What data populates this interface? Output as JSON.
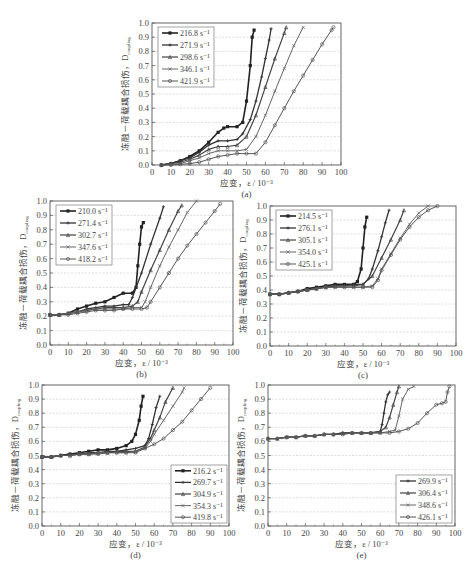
{
  "figure": {
    "y_axis_label": "冻融－荷载耦合损伤，D",
    "y_axis_subscript": "coupling",
    "x_axis_label": "应变，ε / 10⁻³",
    "x_ticks": [
      "0",
      "10",
      "20",
      "30",
      "40",
      "50",
      "60",
      "70",
      "80",
      "90",
      "100"
    ],
    "y_ticks": [
      "0.0",
      "0.1",
      "0.2",
      "0.3",
      "0.4",
      "0.5",
      "0.6",
      "0.7",
      "0.8",
      "0.9",
      "1.0"
    ]
  },
  "chart_data": [
    {
      "id": "a",
      "caption": "(a)",
      "type": "line",
      "xlabel": "应变，ε / 10⁻³",
      "ylabel": "冻融－荷载耦合损伤，D_coupling",
      "xlim": [
        0,
        100
      ],
      "ylim": [
        0,
        1.0
      ],
      "grid": true,
      "legend_position": "upper-left",
      "series": [
        {
          "name": "216.8 s⁻¹",
          "x": [
            5,
            10,
            15,
            20,
            25,
            30,
            35,
            38,
            40,
            45,
            48,
            50,
            52,
            53,
            54
          ],
          "y": [
            0,
            0.01,
            0.03,
            0.06,
            0.1,
            0.16,
            0.23,
            0.26,
            0.27,
            0.27,
            0.3,
            0.45,
            0.7,
            0.9,
            0.95
          ]
        },
        {
          "name": "271.9 s⁻¹",
          "x": [
            5,
            10,
            15,
            20,
            25,
            30,
            35,
            40,
            45,
            48,
            52,
            55,
            58,
            60,
            62,
            63
          ],
          "y": [
            0,
            0.01,
            0.03,
            0.05,
            0.09,
            0.14,
            0.17,
            0.17,
            0.18,
            0.22,
            0.32,
            0.45,
            0.62,
            0.75,
            0.88,
            0.96
          ]
        },
        {
          "name": "298.6 s⁻¹",
          "x": [
            5,
            10,
            15,
            20,
            25,
            30,
            35,
            40,
            45,
            50,
            55,
            60,
            65,
            70,
            71
          ],
          "y": [
            0,
            0.01,
            0.02,
            0.04,
            0.07,
            0.11,
            0.13,
            0.13,
            0.14,
            0.2,
            0.35,
            0.55,
            0.75,
            0.93,
            0.97
          ]
        },
        {
          "name": "346.1 s⁻¹",
          "x": [
            5,
            10,
            15,
            20,
            25,
            30,
            35,
            40,
            45,
            50,
            55,
            60,
            65,
            70,
            75,
            80
          ],
          "y": [
            0,
            0.005,
            0.01,
            0.03,
            0.05,
            0.08,
            0.1,
            0.1,
            0.1,
            0.11,
            0.2,
            0.35,
            0.52,
            0.68,
            0.84,
            0.97
          ]
        },
        {
          "name": "421.9 s⁻¹",
          "x": [
            5,
            10,
            15,
            20,
            25,
            30,
            35,
            40,
            45,
            50,
            55,
            60,
            65,
            70,
            75,
            80,
            85,
            90,
            95,
            96
          ],
          "y": [
            0,
            0.0,
            0.005,
            0.01,
            0.02,
            0.04,
            0.06,
            0.07,
            0.08,
            0.08,
            0.08,
            0.16,
            0.28,
            0.4,
            0.52,
            0.63,
            0.74,
            0.85,
            0.95,
            0.97
          ]
        }
      ]
    },
    {
      "id": "b",
      "caption": "(b)",
      "type": "line",
      "xlabel": "应变，ε / 10⁻³",
      "ylabel": "冻融－荷载耦合损伤，D_coupling",
      "xlim": [
        0,
        100
      ],
      "ylim": [
        0,
        1.0
      ],
      "grid": true,
      "legend_position": "upper-left",
      "series": [
        {
          "name": "210.0 s⁻¹",
          "x": [
            0,
            5,
            10,
            15,
            20,
            25,
            30,
            35,
            40,
            45,
            47,
            48,
            49,
            50,
            51
          ],
          "y": [
            0.21,
            0.21,
            0.22,
            0.25,
            0.27,
            0.29,
            0.3,
            0.33,
            0.36,
            0.36,
            0.4,
            0.55,
            0.7,
            0.82,
            0.85
          ]
        },
        {
          "name": "271.4 s⁻¹",
          "x": [
            0,
            5,
            10,
            15,
            20,
            25,
            30,
            35,
            40,
            43,
            45,
            50,
            55,
            60,
            62
          ],
          "y": [
            0.21,
            0.21,
            0.22,
            0.23,
            0.25,
            0.26,
            0.27,
            0.27,
            0.28,
            0.28,
            0.33,
            0.5,
            0.7,
            0.88,
            0.96
          ]
        },
        {
          "name": "302.7 s⁻¹",
          "x": [
            0,
            5,
            10,
            15,
            20,
            25,
            30,
            35,
            40,
            45,
            48,
            50,
            55,
            60,
            65,
            70,
            72
          ],
          "y": [
            0.21,
            0.21,
            0.22,
            0.23,
            0.24,
            0.25,
            0.26,
            0.26,
            0.26,
            0.27,
            0.3,
            0.37,
            0.52,
            0.66,
            0.8,
            0.93,
            0.97
          ]
        },
        {
          "name": "347.6 s⁻¹",
          "x": [
            0,
            5,
            10,
            15,
            20,
            25,
            30,
            35,
            40,
            45,
            50,
            52,
            55,
            60,
            65,
            70,
            75,
            80
          ],
          "y": [
            0.21,
            0.21,
            0.22,
            0.23,
            0.24,
            0.25,
            0.25,
            0.25,
            0.25,
            0.26,
            0.26,
            0.3,
            0.4,
            0.55,
            0.68,
            0.8,
            0.92,
            1.0
          ]
        },
        {
          "name": "418.2 s⁻¹",
          "x": [
            0,
            5,
            10,
            15,
            20,
            25,
            30,
            35,
            40,
            45,
            50,
            53,
            55,
            60,
            65,
            70,
            75,
            80,
            85,
            90,
            93
          ],
          "y": [
            0.21,
            0.21,
            0.21,
            0.22,
            0.23,
            0.24,
            0.24,
            0.24,
            0.25,
            0.25,
            0.25,
            0.26,
            0.3,
            0.4,
            0.5,
            0.6,
            0.69,
            0.77,
            0.85,
            0.93,
            0.98
          ]
        }
      ]
    },
    {
      "id": "c",
      "caption": "(c)",
      "type": "line",
      "xlabel": "应变，ε / 10⁻³",
      "ylabel": "冻融－荷载耦合损伤，D_coupling",
      "xlim": [
        0,
        100
      ],
      "ylim": [
        0,
        1.0
      ],
      "grid": true,
      "legend_position": "upper-left",
      "series": [
        {
          "name": "214.5 s⁻¹",
          "x": [
            0,
            5,
            10,
            15,
            20,
            25,
            30,
            35,
            40,
            45,
            47,
            49,
            50,
            51,
            52
          ],
          "y": [
            0.37,
            0.37,
            0.38,
            0.39,
            0.41,
            0.42,
            0.43,
            0.44,
            0.44,
            0.44,
            0.46,
            0.55,
            0.7,
            0.85,
            0.92
          ]
        },
        {
          "name": "276.1 s⁻¹",
          "x": [
            0,
            5,
            10,
            15,
            20,
            25,
            30,
            35,
            40,
            45,
            50,
            53,
            55,
            58,
            60,
            62,
            64
          ],
          "y": [
            0.37,
            0.37,
            0.38,
            0.39,
            0.4,
            0.41,
            0.42,
            0.43,
            0.43,
            0.44,
            0.44,
            0.48,
            0.55,
            0.68,
            0.78,
            0.88,
            0.97
          ]
        },
        {
          "name": "305.1 s⁻¹",
          "x": [
            0,
            5,
            10,
            15,
            20,
            25,
            30,
            35,
            40,
            45,
            50,
            55,
            60,
            65,
            70,
            72
          ],
          "y": [
            0.37,
            0.37,
            0.38,
            0.39,
            0.4,
            0.41,
            0.42,
            0.43,
            0.43,
            0.43,
            0.44,
            0.5,
            0.63,
            0.76,
            0.9,
            0.97
          ]
        },
        {
          "name": "354.0 s⁻¹",
          "x": [
            0,
            5,
            10,
            15,
            20,
            25,
            30,
            35,
            40,
            45,
            50,
            55,
            58,
            60,
            65,
            70,
            75,
            80,
            85
          ],
          "y": [
            0.37,
            0.37,
            0.38,
            0.39,
            0.4,
            0.41,
            0.42,
            0.42,
            0.42,
            0.42,
            0.42,
            0.43,
            0.48,
            0.55,
            0.66,
            0.77,
            0.87,
            0.95,
            1.0
          ]
        },
        {
          "name": "425.1 s⁻¹",
          "x": [
            0,
            5,
            10,
            15,
            20,
            25,
            30,
            35,
            40,
            45,
            50,
            55,
            58,
            60,
            65,
            70,
            75,
            80,
            85,
            90
          ],
          "y": [
            0.37,
            0.37,
            0.38,
            0.39,
            0.4,
            0.41,
            0.42,
            0.42,
            0.42,
            0.42,
            0.42,
            0.42,
            0.47,
            0.54,
            0.65,
            0.76,
            0.85,
            0.92,
            0.97,
            1.0
          ]
        }
      ]
    },
    {
      "id": "d",
      "caption": "(d)",
      "type": "line",
      "xlabel": "应变，ε / 10⁻³",
      "ylabel": "冻融－荷载耦合损伤，D_coupling",
      "xlim": [
        0,
        100
      ],
      "ylim": [
        0,
        1.0
      ],
      "grid": true,
      "legend_position": "lower-right",
      "series": [
        {
          "name": "216.2 s⁻¹",
          "x": [
            0,
            5,
            10,
            15,
            20,
            25,
            30,
            35,
            40,
            45,
            48,
            50,
            52,
            53,
            54
          ],
          "y": [
            0.49,
            0.49,
            0.5,
            0.51,
            0.52,
            0.53,
            0.54,
            0.54,
            0.55,
            0.57,
            0.6,
            0.65,
            0.75,
            0.85,
            0.92
          ]
        },
        {
          "name": "269.7 s⁻¹",
          "x": [
            0,
            5,
            10,
            15,
            20,
            25,
            30,
            35,
            40,
            45,
            50,
            55,
            57,
            59,
            61,
            63
          ],
          "y": [
            0.49,
            0.49,
            0.5,
            0.51,
            0.51,
            0.52,
            0.52,
            0.53,
            0.53,
            0.54,
            0.55,
            0.57,
            0.62,
            0.72,
            0.84,
            0.92
          ]
        },
        {
          "name": "304.9 s⁻¹",
          "x": [
            0,
            5,
            10,
            15,
            20,
            25,
            30,
            35,
            40,
            45,
            50,
            55,
            58,
            60,
            63,
            66,
            70
          ],
          "y": [
            0.49,
            0.49,
            0.5,
            0.5,
            0.51,
            0.51,
            0.52,
            0.52,
            0.53,
            0.53,
            0.53,
            0.56,
            0.62,
            0.68,
            0.77,
            0.88,
            0.98
          ]
        },
        {
          "name": "354.3 s⁻¹",
          "x": [
            0,
            5,
            10,
            15,
            20,
            25,
            30,
            35,
            40,
            45,
            50,
            55,
            58,
            60,
            65,
            70,
            75,
            76
          ],
          "y": [
            0.49,
            0.49,
            0.5,
            0.5,
            0.51,
            0.51,
            0.52,
            0.52,
            0.52,
            0.52,
            0.53,
            0.55,
            0.6,
            0.65,
            0.75,
            0.85,
            0.95,
            0.98
          ]
        },
        {
          "name": "419.8 s⁻¹",
          "x": [
            0,
            5,
            10,
            15,
            20,
            25,
            30,
            35,
            40,
            45,
            50,
            55,
            60,
            65,
            70,
            75,
            80,
            85,
            90
          ],
          "y": [
            0.49,
            0.49,
            0.5,
            0.5,
            0.51,
            0.51,
            0.51,
            0.52,
            0.52,
            0.52,
            0.52,
            0.55,
            0.58,
            0.62,
            0.68,
            0.74,
            0.82,
            0.9,
            0.98
          ]
        }
      ]
    },
    {
      "id": "e",
      "caption": "(e)",
      "type": "line",
      "xlabel": "应变，ε / 10⁻³",
      "ylabel": "冻融－荷载耦合损伤，D_coupling",
      "xlim": [
        0,
        100
      ],
      "ylim": [
        0,
        1.0
      ],
      "grid": true,
      "legend_position": "lower-right",
      "series": [
        {
          "name": "269.9 s⁻¹",
          "x": [
            0,
            5,
            10,
            15,
            20,
            25,
            30,
            35,
            40,
            45,
            50,
            55,
            60,
            61,
            62,
            63,
            64,
            65
          ],
          "y": [
            0.62,
            0.62,
            0.63,
            0.63,
            0.64,
            0.64,
            0.65,
            0.65,
            0.66,
            0.66,
            0.66,
            0.66,
            0.67,
            0.72,
            0.8,
            0.88,
            0.93,
            0.95
          ]
        },
        {
          "name": "306.4 s⁻¹",
          "x": [
            0,
            5,
            10,
            15,
            20,
            25,
            30,
            35,
            40,
            45,
            50,
            55,
            60,
            63,
            65,
            67,
            69,
            70
          ],
          "y": [
            0.62,
            0.62,
            0.63,
            0.63,
            0.64,
            0.64,
            0.65,
            0.65,
            0.66,
            0.66,
            0.66,
            0.66,
            0.67,
            0.7,
            0.77,
            0.86,
            0.95,
            0.99
          ]
        },
        {
          "name": "348.6 s⁻¹",
          "x": [
            0,
            5,
            10,
            15,
            20,
            25,
            30,
            35,
            40,
            45,
            50,
            55,
            60,
            65,
            68,
            70,
            72,
            75,
            78
          ],
          "y": [
            0.62,
            0.62,
            0.63,
            0.63,
            0.64,
            0.64,
            0.65,
            0.65,
            0.65,
            0.66,
            0.66,
            0.66,
            0.66,
            0.67,
            0.68,
            0.78,
            0.9,
            0.97,
            0.99
          ]
        },
        {
          "name": "426.1 s⁻¹",
          "x": [
            0,
            5,
            10,
            15,
            20,
            25,
            30,
            35,
            40,
            45,
            50,
            55,
            60,
            65,
            70,
            75,
            80,
            85,
            90,
            93,
            95,
            96,
            97
          ],
          "y": [
            0.62,
            0.62,
            0.63,
            0.63,
            0.64,
            0.64,
            0.65,
            0.65,
            0.65,
            0.66,
            0.66,
            0.66,
            0.66,
            0.66,
            0.67,
            0.69,
            0.73,
            0.8,
            0.86,
            0.87,
            0.88,
            0.95,
            0.99
          ]
        }
      ]
    }
  ]
}
